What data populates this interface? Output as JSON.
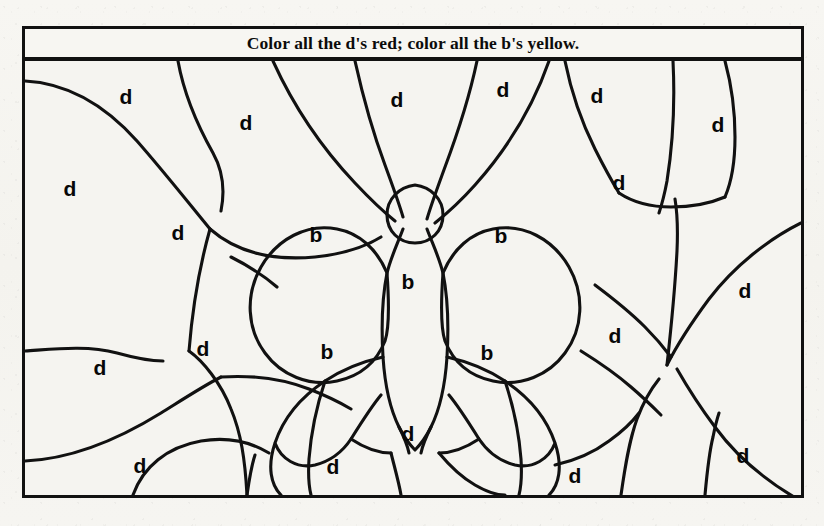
{
  "worksheet": {
    "title": "Color all the d's red; color all the b's yellow.",
    "instruction_colors": {
      "d_color_name": "red",
      "d_color_hex": "#d42b1f",
      "b_color_name": "yellow",
      "b_color_hex": "#f2d32c"
    },
    "picture_subject": "butterfly",
    "ink_color": "#111111",
    "paper_color": "#f5f4f0",
    "frame": {
      "x": 22,
      "y": 26,
      "width": 782,
      "height": 472
    },
    "counts": {
      "d_total": 19,
      "b_total": 6,
      "regions_total": 25
    },
    "labels": [
      {
        "letter": "d",
        "x": 126,
        "y": 96
      },
      {
        "letter": "d",
        "x": 246,
        "y": 122
      },
      {
        "letter": "d",
        "x": 397,
        "y": 99
      },
      {
        "letter": "d",
        "x": 503,
        "y": 89
      },
      {
        "letter": "d",
        "x": 597,
        "y": 95
      },
      {
        "letter": "d",
        "x": 718,
        "y": 124
      },
      {
        "letter": "d",
        "x": 70,
        "y": 188
      },
      {
        "letter": "d",
        "x": 178,
        "y": 232
      },
      {
        "letter": "d",
        "x": 619,
        "y": 182
      },
      {
        "letter": "d",
        "x": 745,
        "y": 290
      },
      {
        "letter": "d",
        "x": 100,
        "y": 367
      },
      {
        "letter": "d",
        "x": 203,
        "y": 348
      },
      {
        "letter": "d",
        "x": 615,
        "y": 335
      },
      {
        "letter": "d",
        "x": 408,
        "y": 433
      },
      {
        "letter": "d",
        "x": 140,
        "y": 465
      },
      {
        "letter": "d",
        "x": 333,
        "y": 466
      },
      {
        "letter": "d",
        "x": 575,
        "y": 475
      },
      {
        "letter": "d",
        "x": 743,
        "y": 455
      },
      {
        "letter": "b",
        "x": 316,
        "y": 234
      },
      {
        "letter": "b",
        "x": 501,
        "y": 235
      },
      {
        "letter": "b",
        "x": 408,
        "y": 281
      },
      {
        "letter": "b",
        "x": 327,
        "y": 351
      },
      {
        "letter": "b",
        "x": 487,
        "y": 352
      }
    ]
  }
}
